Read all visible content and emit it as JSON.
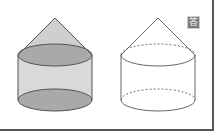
{
  "figure": {
    "badge": {
      "label": "答",
      "meaning": "answer",
      "bg": "#7a7a7a"
    },
    "left_solid": {
      "style": "shaded",
      "fill_cone": "#cfcfcf",
      "fill_cylinder": "#d9d9d9",
      "fill_ellipse": "#a9a9a9",
      "stroke": "#555555"
    },
    "right_solid": {
      "style": "outline",
      "hidden_edges": "dashed",
      "stroke": "#666666"
    },
    "colors": {
      "border": "#555555",
      "background": "#ffffff"
    }
  }
}
